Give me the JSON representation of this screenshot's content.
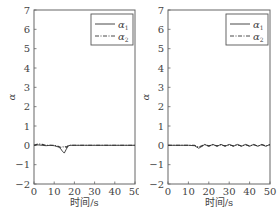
{
  "chart_data": [
    {
      "type": "line",
      "title": "",
      "xlabel": "时间/s",
      "ylabel": "α",
      "xlim": [
        0,
        50
      ],
      "ylim": [
        -2,
        7
      ],
      "xticks": [
        0,
        10,
        20,
        30,
        40,
        50
      ],
      "yticks": [
        -2,
        -1,
        0,
        1,
        2,
        3,
        4,
        5,
        6,
        7
      ],
      "grid": false,
      "legend_position": "upper right",
      "series": [
        {
          "name": "α1",
          "style": "solid",
          "x": [
            0,
            2,
            4,
            6,
            8,
            10,
            12,
            13,
            14,
            15,
            16,
            17,
            18,
            20,
            25,
            30,
            35,
            40,
            45,
            50
          ],
          "y": [
            0,
            0.02,
            0.0,
            -0.02,
            0.0,
            -0.02,
            -0.08,
            -0.15,
            -0.3,
            -0.4,
            -0.2,
            -0.02,
            0.0,
            0.0,
            0.0,
            0.0,
            0.0,
            0.0,
            0.0,
            0.0
          ]
        },
        {
          "name": "α2",
          "style": "dash-dot",
          "x": [
            0,
            2,
            4,
            6,
            8,
            10,
            12,
            13,
            14,
            15,
            16,
            17,
            18,
            20,
            25,
            30,
            35,
            40,
            45,
            50
          ],
          "y": [
            0,
            0.08,
            0.05,
            0.0,
            0.0,
            0.0,
            -0.05,
            -0.1,
            -0.1,
            -0.05,
            -0.1,
            -0.02,
            0.0,
            0.0,
            0.0,
            0.0,
            0.0,
            0.0,
            0.0,
            0.0
          ]
        }
      ]
    },
    {
      "type": "line",
      "title": "",
      "xlabel": "时间/s",
      "ylabel": "α",
      "xlim": [
        0,
        50
      ],
      "ylim": [
        -2,
        7
      ],
      "xticks": [
        0,
        10,
        20,
        30,
        40,
        50
      ],
      "yticks": [
        -2,
        -1,
        0,
        1,
        2,
        3,
        4,
        5,
        6,
        7
      ],
      "grid": false,
      "legend_position": "upper right",
      "series": [
        {
          "name": "α1",
          "style": "solid",
          "x": [
            0,
            5,
            10,
            13,
            15,
            16,
            18,
            20,
            22,
            24,
            26,
            28,
            30,
            32,
            34,
            36,
            38,
            40,
            42,
            44,
            46,
            48,
            50
          ],
          "y": [
            0,
            0,
            0,
            -0.02,
            -0.15,
            -0.1,
            0.05,
            -0.05,
            0.05,
            -0.05,
            0.05,
            -0.05,
            0.05,
            -0.05,
            0.05,
            -0.05,
            0.05,
            -0.05,
            0.05,
            -0.05,
            0.05,
            -0.05,
            0.05
          ]
        },
        {
          "name": "α2",
          "style": "dash-dot",
          "x": [
            0,
            5,
            10,
            13,
            15,
            16,
            18,
            20,
            22,
            24,
            26,
            28,
            30,
            32,
            34,
            36,
            38,
            40,
            42,
            44,
            46,
            48,
            50
          ],
          "y": [
            0,
            0,
            0,
            0.0,
            -0.1,
            -0.05,
            0.03,
            -0.03,
            0.03,
            -0.03,
            0.03,
            -0.03,
            0.03,
            -0.03,
            0.03,
            -0.03,
            0.03,
            -0.03,
            0.03,
            -0.03,
            0.03,
            -0.03,
            0.03
          ]
        }
      ]
    }
  ],
  "plots": [
    {
      "xlabel": "时间/s",
      "ylabel": "α",
      "legend": [
        {
          "label": "α",
          "sub": "1"
        },
        {
          "label": "α",
          "sub": "2"
        }
      ]
    },
    {
      "xlabel": "时间/s",
      "ylabel": "α",
      "legend": [
        {
          "label": "α",
          "sub": "1"
        },
        {
          "label": "α",
          "sub": "2"
        }
      ]
    }
  ],
  "colors": {
    "axis": "#666666",
    "line": "#333333",
    "frame": "#555555"
  }
}
